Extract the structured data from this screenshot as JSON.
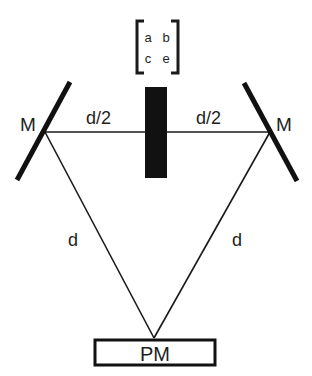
{
  "diagram": {
    "type": "optical-setup",
    "matrix": {
      "entries": [
        [
          "a",
          "b"
        ],
        [
          "c",
          "e"
        ]
      ]
    },
    "mirrors": [
      {
        "id": "left",
        "label": "M"
      },
      {
        "id": "right",
        "label": "M"
      }
    ],
    "sample": {
      "label": ""
    },
    "distances": {
      "left_half": "d/2",
      "right_half": "d/2",
      "left_leg": "d",
      "right_leg": "d"
    },
    "detector": {
      "label": "PM"
    },
    "colors": {
      "stroke": "#1a1a1a",
      "text": "#1e1e1e",
      "background": "#ffffff"
    }
  }
}
